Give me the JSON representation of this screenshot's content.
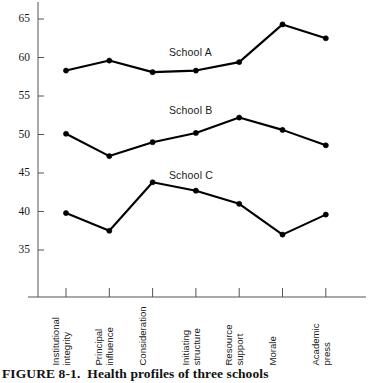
{
  "figure": {
    "caption_prefix": "FIGURE 8-1",
    "caption_sep": ".",
    "caption_text": "Health profiles of three schools"
  },
  "chart_data": {
    "type": "line",
    "title": "",
    "subtitle": "",
    "xlabel": "",
    "ylabel": "",
    "ylim": [
      33,
      67
    ],
    "yticks": [
      35,
      40,
      45,
      50,
      55,
      60,
      65
    ],
    "ytick_labels": [
      "35",
      "40",
      "45",
      "50",
      "55",
      "60",
      "65"
    ],
    "grid": false,
    "legend_position": "inline-annotation",
    "categories": [
      "Institutional integrity",
      "Principal influence",
      "Consideration",
      "Initiating structure",
      "Resource support",
      "Morale",
      "Academic press"
    ],
    "category_lines": [
      [
        "Institutional",
        "integrity"
      ],
      [
        "Principal",
        "influence"
      ],
      [
        "Consideration",
        ""
      ],
      [
        "Initiating",
        "structure"
      ],
      [
        "Resource",
        "support"
      ],
      [
        "Morale",
        ""
      ],
      [
        "Academic",
        "press"
      ]
    ],
    "series": [
      {
        "name": "School A",
        "values": [
          58.3,
          59.6,
          58.1,
          58.3,
          59.4,
          64.3,
          62.5
        ],
        "color": "#000000"
      },
      {
        "name": "School B",
        "values": [
          50.1,
          47.2,
          49.0,
          50.2,
          52.2,
          50.6,
          48.6
        ],
        "color": "#000000"
      },
      {
        "name": "School C",
        "values": [
          39.8,
          37.5,
          43.8,
          42.7,
          41.0,
          37.0,
          39.6
        ],
        "color": "#000000"
      }
    ],
    "annotations": [
      {
        "text": "School A",
        "x_index": 3,
        "value": 60.6
      },
      {
        "text": "School B",
        "x_index": 3,
        "value": 53.1
      },
      {
        "text": "School C",
        "x_index": 3,
        "value": 44.6
      }
    ]
  },
  "colors": {
    "axis": "#555555",
    "line": "#000000",
    "marker": "#000000",
    "text": "#1a1a1a",
    "background": "#ffffff"
  }
}
